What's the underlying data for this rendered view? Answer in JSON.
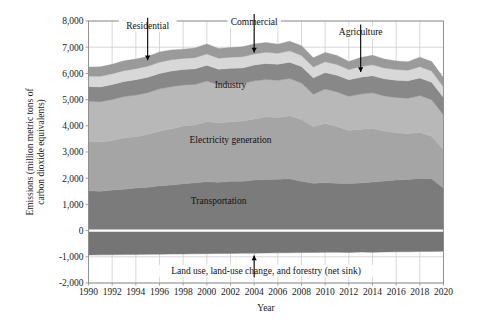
{
  "chart_data": {
    "type": "area",
    "stacked": true,
    "title": "",
    "xlabel": "Year",
    "ylabel": "Emissions (million metric tons of carbon dioxide equivalents)",
    "xlim": [
      1990,
      2020
    ],
    "ylim": [
      -2000,
      8000
    ],
    "ytick_labels": [
      "8,000",
      "7,000",
      "6,000",
      "5,000",
      "4,000",
      "3,000",
      "2,000",
      "1,000",
      "0",
      "-1,000",
      "-2,000"
    ],
    "yticks": [
      8000,
      7000,
      6000,
      5000,
      4000,
      3000,
      2000,
      1000,
      0,
      -1000,
      -2000
    ],
    "xtick_labels": [
      "1990",
      "1992",
      "1994",
      "1996",
      "1998",
      "2000",
      "2002",
      "2004",
      "2006",
      "2008",
      "2010",
      "2012",
      "2014",
      "2016",
      "2018",
      "2020"
    ],
    "xticks": [
      1990,
      1992,
      1994,
      1996,
      1998,
      2000,
      2002,
      2004,
      2006,
      2008,
      2010,
      2012,
      2014,
      2016,
      2018,
      2020
    ],
    "grid": true,
    "legend": "inline-annotations",
    "x": [
      1990,
      1991,
      1992,
      1993,
      1994,
      1995,
      1996,
      1997,
      1998,
      1999,
      2000,
      2001,
      2002,
      2003,
      2004,
      2005,
      2006,
      2007,
      2008,
      2009,
      2010,
      2011,
      2012,
      2013,
      2014,
      2015,
      2016,
      2017,
      2018,
      2019,
      2020
    ],
    "series": [
      {
        "name": "Transportation",
        "color": "#7b7b7b",
        "values": [
          1520,
          1500,
          1545,
          1580,
          1625,
          1655,
          1710,
          1745,
          1790,
          1830,
          1865,
          1845,
          1880,
          1880,
          1930,
          1950,
          1960,
          1975,
          1885,
          1810,
          1830,
          1810,
          1795,
          1820,
          1855,
          1890,
          1930,
          1955,
          1990,
          1975,
          1625
        ]
      },
      {
        "name": "Electricity generation",
        "color": "#a5a5a5",
        "values": [
          1860,
          1880,
          1890,
          1960,
          1960,
          2010,
          2080,
          2140,
          2200,
          2200,
          2300,
          2260,
          2270,
          2300,
          2330,
          2400,
          2360,
          2410,
          2360,
          2160,
          2260,
          2160,
          2030,
          2050,
          2040,
          1910,
          1810,
          1745,
          1765,
          1625,
          1465
        ]
      },
      {
        "name": "Industry",
        "color": "#b8b8b8",
        "values": [
          1560,
          1540,
          1570,
          1575,
          1590,
          1600,
          1620,
          1610,
          1570,
          1550,
          1545,
          1460,
          1450,
          1430,
          1455,
          1420,
          1415,
          1420,
          1385,
          1235,
          1310,
          1320,
          1300,
          1340,
          1365,
          1340,
          1340,
          1350,
          1400,
          1395,
          1325
        ]
      },
      {
        "name": "Agriculture",
        "color": "#888888",
        "values": [
          560,
          565,
          570,
          575,
          585,
          590,
          585,
          595,
          590,
          595,
          600,
          595,
          595,
          600,
          605,
          610,
          615,
          625,
          630,
          625,
          630,
          640,
          635,
          645,
          655,
          655,
          660,
          665,
          670,
          670,
          665
        ]
      },
      {
        "name": "Commercial",
        "color": "#d8d8d8",
        "values": [
          395,
          405,
          410,
          415,
          420,
          420,
          435,
          430,
          420,
          425,
          430,
          420,
          420,
          425,
          425,
          425,
          415,
          430,
          425,
          410,
          415,
          410,
          385,
          405,
          415,
          410,
          405,
          405,
          430,
          425,
          400
        ]
      },
      {
        "name": "Residential",
        "color": "#9a9a9a",
        "values": [
          345,
          360,
          360,
          375,
          370,
          370,
          390,
          375,
          355,
          370,
          385,
          370,
          370,
          380,
          375,
          375,
          350,
          370,
          370,
          355,
          355,
          345,
          310,
          345,
          360,
          340,
          330,
          325,
          365,
          360,
          350
        ]
      }
    ],
    "negative_series": {
      "name": "Land use, land-use change, and forestry (net sink)",
      "color": "#757575",
      "values": [
        -930,
        -925,
        -920,
        -915,
        -910,
        -905,
        -900,
        -895,
        -890,
        -885,
        -880,
        -875,
        -870,
        -865,
        -860,
        -855,
        -850,
        -845,
        -840,
        -835,
        -830,
        -825,
        -835,
        -820,
        -830,
        -815,
        -810,
        -805,
        -800,
        -795,
        -790
      ]
    },
    "inline_labels": [
      {
        "text": "Industry",
        "x": 2002,
        "y": 5450
      },
      {
        "text": "Electricity generation",
        "x": 2002,
        "y": 3350
      },
      {
        "text": "Transportation",
        "x": 2001,
        "y": 1000
      }
    ],
    "callouts": [
      {
        "text": "Residential",
        "x": 1995,
        "y": 7700,
        "target_x": 1995,
        "target_y": 6500
      },
      {
        "text": "Commercial",
        "x": 2004,
        "y": 7850,
        "target_x": 2004,
        "target_y": 6800
      },
      {
        "text": "Agriculture",
        "x": 2013,
        "y": 7450,
        "target_x": 2013,
        "target_y": 6050
      },
      {
        "text": "Land use, land-use change, and forestry (net sink)",
        "x": 2005,
        "y": -1650,
        "target_x": 2004,
        "target_y": -950
      }
    ]
  }
}
